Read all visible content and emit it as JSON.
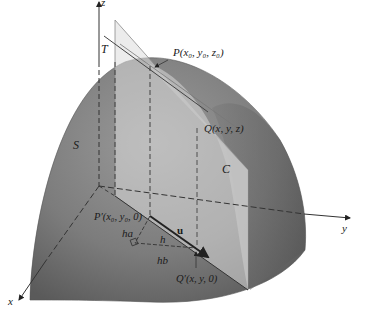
{
  "figure": {
    "surface_label": "S",
    "plane_label": "T",
    "curve_label": "C",
    "point_P": "P(x₀, y₀, z₀)",
    "point_Q": "Q(x, y, z)",
    "point_P_prime": "P′(x₀, y₀, 0)",
    "point_Q_prime": "Q′(x, y, 0)",
    "vector_u": "u",
    "segment_h": "h",
    "segment_ha": "ha",
    "segment_hb": "hb",
    "axes": {
      "x": "x",
      "y": "y",
      "z": "z"
    }
  },
  "colors": {
    "surface_dark": "#5e5e5e",
    "surface_mid": "#8a8a8a",
    "surface_light": "#b0b0b0",
    "plane_fill": "#d6d6d6",
    "axis": "#333333",
    "text": "#1a1a1a"
  }
}
